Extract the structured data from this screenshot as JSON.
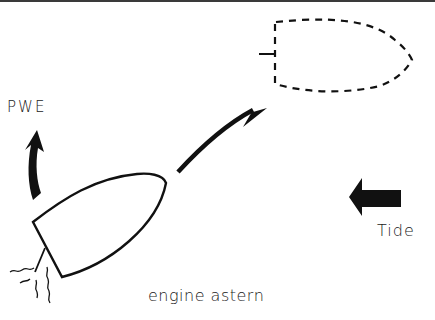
{
  "diagram": {
    "type": "boat-maneuver",
    "labels": {
      "pwe": "PWE",
      "tide": "Tide",
      "caption": "engine astern"
    },
    "elements": {
      "boat_current": "solid-outline-hull",
      "boat_target": "dashed-outline-hull",
      "propeller_wash": "wavy-lines",
      "pwe_arrow": "curved-up-arrow",
      "movement_arrow": "curved-arrow-to-target",
      "tide_arrow": "left-block-arrow"
    },
    "colors": {
      "ink": "#111111",
      "background": "#ffffff"
    }
  }
}
